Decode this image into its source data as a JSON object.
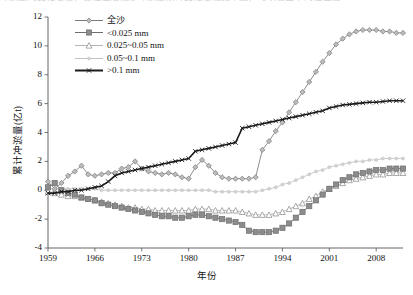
{
  "figure": {
    "top_text_artifact": "冲淤量的变化过程，各粒径组泥沙冲淤量累计变化过程见下图，可以看出不同粒径组"
  },
  "axes": {
    "x_title": "年份",
    "y_title": "累计冲淤量(亿t)",
    "x_ticks": [
      "1959",
      "1966",
      "1973",
      "1980",
      "1987",
      "1994",
      "2001",
      "2008"
    ],
    "y_ticks": [
      "12",
      "10",
      "8",
      "6",
      "4",
      "2",
      "0",
      "-2",
      "-4"
    ]
  },
  "legend": {
    "position": "top-left-inside",
    "entries": [
      {
        "label": "全沙",
        "marker": "diamond",
        "color": "#7a7a7a"
      },
      {
        "label": "<0.025 mm",
        "marker": "square",
        "color": "#6e6e6e"
      },
      {
        "label": "0.025~0.05 mm",
        "marker": "triangle",
        "color": "#b4b4b4"
      },
      {
        "label": "0.05~0.1 mm",
        "marker": "circle",
        "color": "#c2c2c2"
      },
      {
        "label": ">0.1 mm",
        "marker": "cross",
        "color": "#1a1a1a"
      }
    ]
  },
  "chart_data": {
    "type": "line",
    "title": "",
    "xlabel": "年份",
    "ylabel": "累计冲淤量(亿t)",
    "xlim": [
      1959,
      2012
    ],
    "ylim": [
      -4,
      12
    ],
    "ytick_step": 2,
    "xtick_step": 7,
    "grid": false,
    "legend_position": "upper-left",
    "x": [
      1959,
      1960,
      1961,
      1962,
      1963,
      1964,
      1965,
      1966,
      1967,
      1968,
      1969,
      1970,
      1971,
      1972,
      1973,
      1974,
      1975,
      1976,
      1977,
      1978,
      1979,
      1980,
      1981,
      1982,
      1983,
      1984,
      1985,
      1986,
      1987,
      1988,
      1989,
      1990,
      1991,
      1992,
      1993,
      1994,
      1995,
      1996,
      1997,
      1998,
      1999,
      2000,
      2001,
      2002,
      2003,
      2004,
      2005,
      2006,
      2007,
      2008,
      2009,
      2010,
      2011,
      2012
    ],
    "series": [
      {
        "name": "全沙",
        "marker": "diamond",
        "color": "#7a7a7a",
        "values": [
          0.6,
          0.1,
          0.5,
          1.0,
          1.3,
          1.7,
          1.1,
          1.0,
          1.1,
          1.2,
          1.2,
          1.5,
          1.6,
          2.0,
          1.5,
          1.3,
          1.2,
          1.1,
          1.2,
          1.1,
          0.9,
          0.8,
          1.6,
          2.1,
          1.7,
          1.2,
          0.9,
          0.8,
          0.8,
          0.8,
          0.8,
          0.9,
          2.8,
          3.4,
          4.1,
          4.7,
          5.4,
          6.1,
          6.8,
          7.5,
          8.2,
          8.9,
          9.5,
          10.1,
          10.5,
          10.8,
          11.0,
          11.1,
          11.1,
          11.1,
          11.0,
          11.0,
          10.9,
          10.9
        ]
      },
      {
        "name": "<0.025 mm",
        "marker": "square",
        "color": "#6e6e6e",
        "values": [
          0.2,
          0.5,
          0.0,
          -0.2,
          -0.3,
          -0.5,
          -0.6,
          -0.7,
          -0.9,
          -1.0,
          -1.1,
          -1.2,
          -1.3,
          -1.4,
          -1.5,
          -1.6,
          -1.7,
          -1.8,
          -1.8,
          -1.9,
          -1.9,
          -1.8,
          -1.7,
          -1.7,
          -1.8,
          -1.9,
          -2.0,
          -2.1,
          -2.2,
          -2.4,
          -2.8,
          -2.9,
          -2.9,
          -2.9,
          -2.8,
          -2.6,
          -2.3,
          -1.9,
          -1.5,
          -1.1,
          -0.7,
          -0.3,
          0.1,
          0.4,
          0.7,
          0.9,
          1.1,
          1.2,
          1.3,
          1.4,
          1.4,
          1.5,
          1.5,
          1.5
        ]
      },
      {
        "name": "0.025~0.05 mm",
        "marker": "triangle",
        "color": "#b4b4b4",
        "values": [
          -0.1,
          -0.2,
          -0.3,
          -0.4,
          -0.4,
          -0.5,
          -0.6,
          -0.7,
          -0.8,
          -0.9,
          -1.0,
          -1.1,
          -1.2,
          -1.2,
          -1.3,
          -1.3,
          -1.4,
          -1.4,
          -1.4,
          -1.4,
          -1.4,
          -1.4,
          -1.3,
          -1.3,
          -1.3,
          -1.4,
          -1.4,
          -1.4,
          -1.4,
          -1.5,
          -1.6,
          -1.7,
          -1.7,
          -1.7,
          -1.6,
          -1.5,
          -1.3,
          -1.1,
          -0.9,
          -0.6,
          -0.4,
          -0.1,
          0.1,
          0.3,
          0.5,
          0.7,
          0.8,
          0.9,
          1.0,
          1.1,
          1.1,
          1.2,
          1.2,
          1.2
        ]
      },
      {
        "name": "0.05~0.1 mm",
        "marker": "circle",
        "color": "#c2c2c2",
        "values": [
          0.1,
          0.1,
          0.1,
          0.1,
          0.1,
          0.1,
          0.1,
          0.1,
          0.0,
          0.0,
          0.0,
          0.0,
          0.0,
          0.0,
          0.0,
          0.0,
          0.0,
          0.0,
          0.0,
          0.0,
          0.0,
          0.0,
          0.0,
          0.0,
          0.0,
          -0.1,
          -0.1,
          -0.1,
          -0.1,
          -0.1,
          -0.1,
          -0.1,
          0.0,
          0.1,
          0.2,
          0.4,
          0.5,
          0.7,
          0.9,
          1.1,
          1.3,
          1.4,
          1.6,
          1.7,
          1.8,
          1.9,
          2.0,
          2.0,
          2.1,
          2.1,
          2.2,
          2.2,
          2.2,
          2.2
        ]
      },
      {
        "name": ">0.1 mm",
        "marker": "cross",
        "color": "#1a1a1a",
        "values": [
          -0.2,
          -0.2,
          -0.1,
          -0.1,
          0.0,
          0.0,
          0.1,
          0.2,
          0.3,
          0.6,
          1.0,
          1.2,
          1.3,
          1.4,
          1.5,
          1.6,
          1.7,
          1.8,
          1.9,
          2.0,
          2.1,
          2.2,
          2.7,
          2.8,
          2.9,
          3.0,
          3.1,
          3.2,
          3.3,
          4.3,
          4.4,
          4.5,
          4.6,
          4.7,
          4.8,
          4.9,
          5.0,
          5.1,
          5.2,
          5.3,
          5.4,
          5.5,
          5.7,
          5.8,
          5.9,
          5.95,
          6.0,
          6.05,
          6.1,
          6.1,
          6.15,
          6.2,
          6.2,
          6.2
        ]
      }
    ]
  }
}
